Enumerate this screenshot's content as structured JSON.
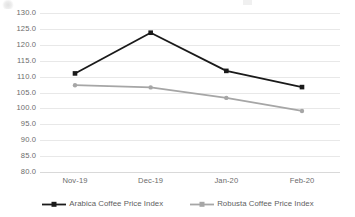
{
  "chart_data": {
    "type": "line",
    "title": "",
    "subtitle": "",
    "xlabel": "",
    "ylabel": "",
    "categories": [
      "Nov-19",
      "Dec-19",
      "Jan-20",
      "Feb-20"
    ],
    "ylim": [
      80.0,
      130.0
    ],
    "ytick_step": 5.0,
    "ytick_labels": [
      "130.0",
      "125.0",
      "120.0",
      "115.0",
      "110.0",
      "105.0",
      "100.0",
      "95.0",
      "90.0",
      "85.0",
      "80.0"
    ],
    "ytick_values": [
      130.0,
      125.0,
      120.0,
      115.0,
      110.0,
      105.0,
      100.0,
      95.0,
      90.0,
      85.0,
      80.0
    ],
    "grid": true,
    "grid_axis": "y",
    "legend_position": "bottom",
    "markers": true,
    "series": [
      {
        "name": "Arabica Coffee Price Index",
        "color": "#1a1a1a",
        "marker": "square",
        "values": [
          111.0,
          123.8,
          111.8,
          106.7
        ]
      },
      {
        "name": "Robusta Coffee Price Index",
        "color": "#a6a6a6",
        "marker": "circle",
        "values": [
          107.3,
          106.6,
          103.3,
          99.2
        ]
      }
    ]
  },
  "axes": {
    "y_labels": [
      "130.0",
      "125.0",
      "120.0",
      "115.0",
      "110.0",
      "105.0",
      "100.0",
      "95.0",
      "90.0",
      "85.0",
      "80.0"
    ],
    "x_labels": [
      "Nov-19",
      "Dec-19",
      "Jan-20",
      "Feb-20"
    ]
  },
  "legend": {
    "items": [
      {
        "label": "Arabica Coffee Price Index",
        "color": "#1a1a1a"
      },
      {
        "label": "Robusta Coffee Price Index",
        "color": "#a6a6a6"
      }
    ]
  },
  "colors": {
    "arabica": "#1a1a1a",
    "robusta": "#a6a6a6",
    "gridline": "#e8e8e8",
    "axis": "#d9d9d9",
    "tick_text": "#6b6b6b",
    "background": "#ffffff"
  }
}
